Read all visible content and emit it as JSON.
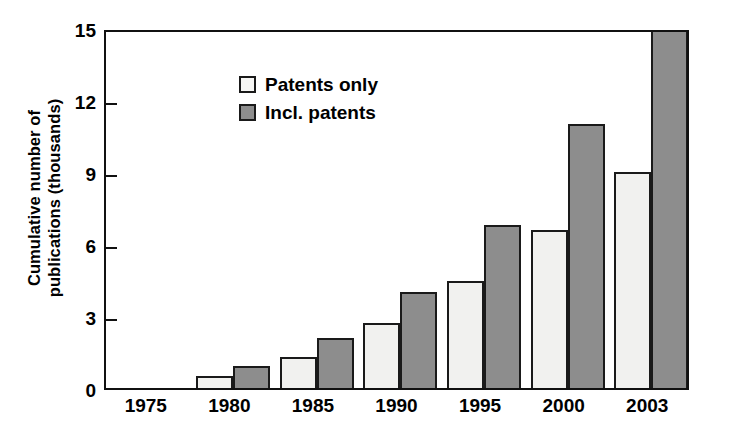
{
  "chart_data": {
    "type": "bar",
    "title": "",
    "subtitle": "",
    "xlabel": "",
    "ylabel_line1": "Cumulative number of",
    "ylabel_line2": "publications (thousands)",
    "ylabel": "Cumulative number of publications (thousands)",
    "categories": [
      "1975",
      "1980",
      "1985",
      "1990",
      "1995",
      "2000",
      "2003"
    ],
    "series": [
      {
        "name": "Patents only",
        "color": "#f1f1ef",
        "values": [
          0,
          0.5,
          1.3,
          2.7,
          4.45,
          6.6,
          9.0
        ]
      },
      {
        "name": "Incl. patents",
        "color": "#8d8d8d",
        "values": [
          0,
          0.9,
          2.1,
          4.0,
          6.8,
          11.0,
          15.0
        ]
      }
    ],
    "ylim": [
      0,
      15
    ],
    "yticks": [
      "0",
      "3",
      "6",
      "9",
      "12",
      "15"
    ],
    "ytick_values": [
      0,
      3,
      6,
      9,
      12,
      15
    ],
    "grid": false,
    "legend_position": "top-left"
  },
  "colors": {
    "axis": "#111111",
    "bar_outline": "#1a1a1a",
    "series_light": "#f1f1ef",
    "series_dark": "#8d8d8d",
    "background": "#ffffff"
  }
}
